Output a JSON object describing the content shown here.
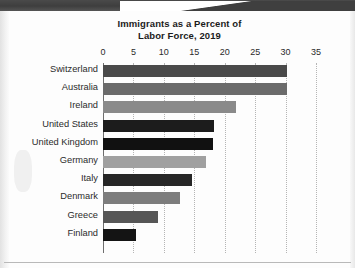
{
  "chart_data": {
    "type": "bar",
    "orientation": "horizontal",
    "title": "Immigrants as a Percent of Labor Force, 2019",
    "title_lines": [
      "Immigrants as a Percent of",
      "Labor Force, 2019"
    ],
    "xlabel": "",
    "ylabel": "",
    "xlim": [
      0,
      35
    ],
    "xticks": [
      0,
      5,
      10,
      15,
      20,
      25,
      30,
      35
    ],
    "xtick_labels": [
      "0",
      "5",
      "10",
      "15",
      "20",
      "25",
      "30",
      "35"
    ],
    "grid": "vertical-dotted",
    "legend": "none",
    "categories": [
      "Switzerland",
      "Australia",
      "Ireland",
      "United States",
      "United Kingdom",
      "Germany",
      "Italy",
      "Denmark",
      "Greece",
      "Finland"
    ],
    "values": [
      30.3,
      30.2,
      21.9,
      18.2,
      18.0,
      16.9,
      14.7,
      12.6,
      9.0,
      5.4
    ],
    "bar_colors": [
      "#4a4a4a",
      "#6b6b6b",
      "#8a8a8a",
      "#1c1c1c",
      "#111111",
      "#a0a0a0",
      "#262626",
      "#7d7d7d",
      "#565656",
      "#141414"
    ]
  },
  "style": {
    "axis_color": "#6e6e6e",
    "grid_color": "#b5b5b5",
    "text_color": "#2b2b2b",
    "title_color": "#1b1b1b",
    "page_background": "#fdfdfd"
  }
}
